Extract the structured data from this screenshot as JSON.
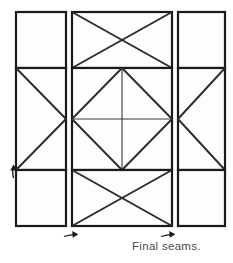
{
  "figure": {
    "title": "Final seams.",
    "type": "quilt-block-assembly-diagram",
    "caption": "Final seams."
  },
  "style": {
    "outline_color": "#1a1a1a",
    "seam_color": "#2b2b2b",
    "patch_fill": "#fdfdfb",
    "background": "#ffffff",
    "caption_color": "#4a4a4a",
    "outline_width": 2.2,
    "seam_width": 1.9,
    "inner_line_width": 1.1
  },
  "layout": {
    "columns": [
      {
        "name": "left-column",
        "x": 16,
        "width": 50
      },
      {
        "name": "center-column",
        "x": 72,
        "width": 100
      },
      {
        "name": "right-column",
        "x": 178,
        "width": 47
      }
    ],
    "rows": [
      {
        "name": "top-row",
        "y": 12,
        "height": 56
      },
      {
        "name": "middle-row",
        "y": 68,
        "height": 102
      },
      {
        "name": "bottom-row",
        "y": 170,
        "height": 56
      }
    ]
  },
  "patches": [
    {
      "id": "left-top-square",
      "label": "plain corner square",
      "x": 16,
      "y": 12,
      "w": 50,
      "h": 56,
      "pattern": "plain"
    },
    {
      "id": "left-middle-rect",
      "label": "side triangle unit pointing right",
      "x": 16,
      "y": 68,
      "w": 50,
      "h": 102,
      "pattern": "triangle-right"
    },
    {
      "id": "left-bottom-square",
      "label": "plain corner square",
      "x": 16,
      "y": 170,
      "w": 50,
      "h": 56,
      "pattern": "plain"
    },
    {
      "id": "center-top-band",
      "label": "flying geese band with crossed seams",
      "x": 72,
      "y": 12,
      "w": 100,
      "h": 56,
      "pattern": "x-cross"
    },
    {
      "id": "center-middle-band",
      "label": "center diamond unit with quartering seams",
      "x": 72,
      "y": 68,
      "w": 100,
      "h": 102,
      "pattern": "diamond-quartered"
    },
    {
      "id": "center-bottom-band",
      "label": "flying geese band with crossed seams",
      "x": 72,
      "y": 170,
      "w": 100,
      "h": 56,
      "pattern": "x-cross"
    },
    {
      "id": "right-top-square",
      "label": "plain corner square",
      "x": 178,
      "y": 12,
      "w": 47,
      "h": 56,
      "pattern": "plain"
    },
    {
      "id": "right-middle-rect",
      "label": "side triangle unit pointing left",
      "x": 178,
      "y": 68,
      "w": 47,
      "h": 102,
      "pattern": "triangle-left"
    },
    {
      "id": "right-bottom-square",
      "label": "plain corner square",
      "x": 178,
      "y": 170,
      "w": 47,
      "h": 56,
      "pattern": "plain"
    }
  ],
  "arrows": [
    {
      "id": "left-seam-arrow",
      "label": "seam direction arrow pointing up at left edge",
      "direction": "up",
      "x": 10,
      "y": 170
    },
    {
      "id": "center-left-seam-arrow",
      "label": "seam direction arrow pointing right below center column",
      "direction": "right",
      "x": 66,
      "y": 234
    },
    {
      "id": "center-right-seam-arrow",
      "label": "seam direction arrow pointing right below right seam",
      "direction": "right",
      "x": 163,
      "y": 234
    }
  ]
}
